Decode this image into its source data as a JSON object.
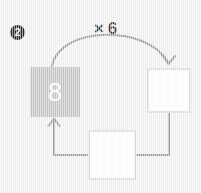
{
  "problem": {
    "number_badge": "2",
    "operation_label": "× 6"
  },
  "boxes": [
    {
      "id": "start",
      "kind": "filled",
      "value": "8",
      "role": "given-value"
    },
    {
      "id": "right",
      "kind": "empty",
      "value": "",
      "role": "answer-blank"
    },
    {
      "id": "bottom",
      "kind": "empty",
      "value": "",
      "role": "answer-blank"
    }
  ],
  "colors": {
    "page_background": "#f1f1f1",
    "filled_box": "#c4c4c4",
    "filled_box_text": "#ffffff",
    "empty_box_fill": "#ffffff",
    "empty_box_border": "#dcdcdc",
    "connector": "#9a9a9a",
    "label_text": "#3a3a3a",
    "badge_fill": "#2b2b2b",
    "badge_text": "#ffffff"
  },
  "connectors": [
    {
      "name": "start-to-right",
      "style": "curved-arrow",
      "label": "× 6",
      "from": "start",
      "to": "right"
    },
    {
      "name": "right-to-bottom",
      "style": "elbow-line",
      "from": "right",
      "to": "bottom"
    },
    {
      "name": "bottom-to-start",
      "style": "elbow-arrow",
      "from": "bottom",
      "to": "start"
    }
  ]
}
